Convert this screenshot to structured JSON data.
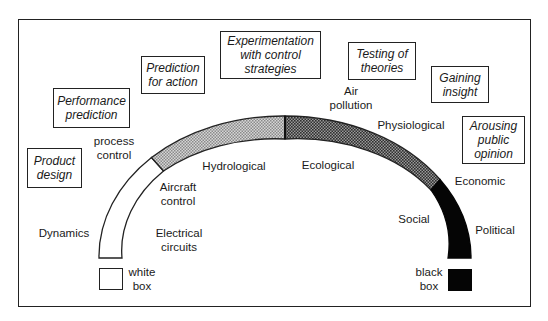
{
  "purpose_boxes": [
    {
      "id": "product-design",
      "lines": [
        "Product",
        "design"
      ]
    },
    {
      "id": "performance-prediction",
      "lines": [
        "Performance",
        "prediction"
      ]
    },
    {
      "id": "prediction-for-action",
      "lines": [
        "Prediction",
        "for action"
      ]
    },
    {
      "id": "experimentation",
      "lines": [
        "Experimentation",
        "with control",
        "strategies"
      ]
    },
    {
      "id": "testing-of-theories",
      "lines": [
        "Testing of",
        "theories"
      ]
    },
    {
      "id": "gaining-insight",
      "lines": [
        "Gaining",
        "insight"
      ]
    },
    {
      "id": "arousing-public-opinion",
      "lines": [
        "Arousing",
        "public",
        "opinion"
      ]
    }
  ],
  "outer_labels": [
    {
      "id": "dynamics",
      "lines": [
        "Dynamics"
      ]
    },
    {
      "id": "process-control",
      "lines": [
        "process",
        "control"
      ]
    },
    {
      "id": "air-pollution",
      "lines": [
        "Air",
        "pollution"
      ]
    },
    {
      "id": "physiological",
      "lines": [
        "Physiological"
      ]
    },
    {
      "id": "economic",
      "lines": [
        "Economic"
      ]
    },
    {
      "id": "political",
      "lines": [
        "Political"
      ]
    }
  ],
  "inner_labels": [
    {
      "id": "electrical-circuits",
      "lines": [
        "Electrical",
        "circuits"
      ]
    },
    {
      "id": "aircraft-control",
      "lines": [
        "Aircraft",
        "control"
      ]
    },
    {
      "id": "hydrological",
      "lines": [
        "Hydrological"
      ]
    },
    {
      "id": "ecological",
      "lines": [
        "Ecological"
      ]
    },
    {
      "id": "social",
      "lines": [
        "Social"
      ]
    }
  ],
  "legend": {
    "white": {
      "lines": [
        "white",
        "box"
      ],
      "color": "#ffffff"
    },
    "black": {
      "lines": [
        "black",
        "box"
      ],
      "color": "#000000"
    }
  },
  "spectrum_segments": [
    {
      "name": "white-box-segment",
      "fill": "#ffffff"
    },
    {
      "name": "light-gray-segment",
      "fill": "light-dots"
    },
    {
      "name": "medium-gray-segment",
      "fill": "dense-dots"
    },
    {
      "name": "black-box-segment",
      "fill": "#000000"
    }
  ],
  "colors": {
    "line": "#222222",
    "light_dot": "#8a8a8a",
    "dense_dot": "#3a3a3a",
    "black": "#050505"
  }
}
